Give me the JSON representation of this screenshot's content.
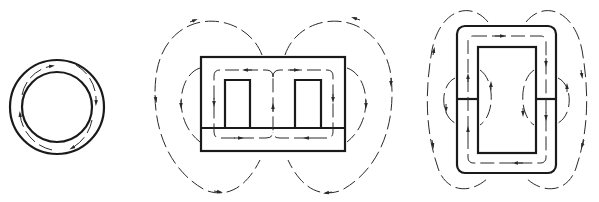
{
  "diagram": {
    "colors": {
      "background": "#ffffff",
      "core": "#1a1a1a",
      "flux": "#2a2a2a"
    },
    "figures": [
      {
        "id": "toroid",
        "label": "Toroidal core",
        "description": "Ring core with circulating flux arrows inside the core"
      },
      {
        "id": "shell",
        "label": "Shell-type core with air gap",
        "description": "Rectangular core with two windows, horizontal gap, internal flux loops and external leakage flux lines"
      },
      {
        "id": "core-type",
        "label": "Core-type (rectangular) core with air gaps",
        "description": "Rounded rectangular core with gaps in both legs, internal flux loop and fringing/leakage flux lines"
      }
    ]
  }
}
